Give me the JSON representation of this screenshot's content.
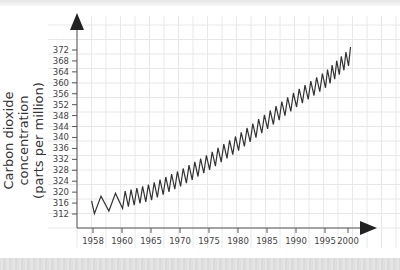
{
  "chart_data": {
    "type": "line",
    "title": "",
    "xlabel": "",
    "ylabel": "Carbon dioxide concentration (parts per million)",
    "ylabel_lines": [
      "Carbon dioxide concentration",
      "(parts per million)"
    ],
    "x_ticks": [
      "1958",
      "1960",
      "1965",
      "1970",
      "1975",
      "1980",
      "1985",
      "1990",
      "1995",
      "2000"
    ],
    "y_ticks": [
      312,
      316,
      320,
      324,
      328,
      332,
      336,
      340,
      344,
      348,
      352,
      356,
      360,
      364,
      368,
      372
    ],
    "ylim": [
      308,
      376
    ],
    "xlim": [
      1957,
      2003
    ],
    "grid": true,
    "legend": null,
    "series": [
      {
        "name": "Atmospheric CO2 (seasonal oscillation)",
        "color": "#333333",
        "x": [
          1958,
          1960,
          1965,
          1970,
          1975,
          1980,
          1985,
          1990,
          1995,
          2000,
          2001
        ],
        "values": [
          315,
          317,
          320,
          325,
          331,
          338,
          346,
          354,
          361,
          369,
          371
        ],
        "seasonal_amplitude_ppm": 6
      }
    ]
  },
  "axis": {
    "y_label_line1": "Carbon dioxide concentration",
    "y_label_line2": "(parts per million)"
  }
}
